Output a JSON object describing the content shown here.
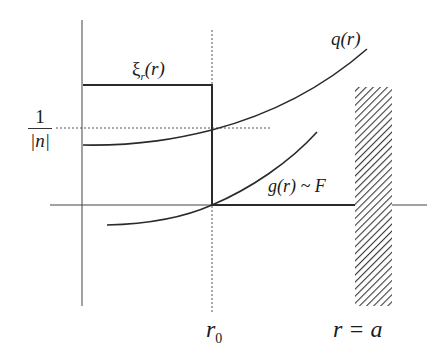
{
  "diagram": {
    "labels": {
      "xi": "ξ",
      "xi_sub": "r",
      "xi_arg": "(r)",
      "q": "q(r)",
      "one": "1",
      "abs_n": "|n|",
      "g": "g(r) ~ F",
      "r0": "r",
      "r0_sub": "0",
      "ra": "r = a"
    },
    "colors": {
      "line": "#2a2a2a",
      "dashed": "#555555",
      "hatch": "#3a3a3a",
      "background": "#ffffff"
    },
    "elements": [
      "vertical axis",
      "horizontal r axis",
      "dashed line at r0",
      "step function xi_r(r)",
      "curve q(r)",
      "curve g(r) ~ F",
      "dashed level 1/|n|",
      "hatched wall at r = a"
    ]
  }
}
